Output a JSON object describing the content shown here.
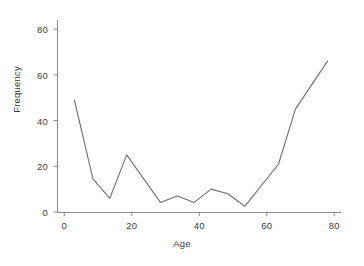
{
  "chart_data": {
    "type": "line",
    "title": "",
    "subtitle": "",
    "xlabel": "Age",
    "ylabel": "Frequency",
    "xlim": [
      -2,
      82
    ],
    "ylim": [
      0,
      84
    ],
    "xticks": [
      0,
      20,
      40,
      60,
      80
    ],
    "xtick_labels": [
      "0",
      "20",
      "40",
      "60",
      "80"
    ],
    "yticks": [
      0,
      20,
      40,
      60,
      80
    ],
    "ytick_labels": [
      "0",
      "20",
      "40",
      "60",
      "80"
    ],
    "grid": false,
    "legend": false,
    "legend_position": "none",
    "line_color": "#6e6e6e",
    "line_width": 1.1,
    "markers": false,
    "x": [
      3,
      8.5,
      13.5,
      18.5,
      28.5,
      33.5,
      38.5,
      43.5,
      48.5,
      53.5,
      63.5,
      68.5,
      78
    ],
    "y": [
      49,
      14.5,
      6,
      25,
      4.2,
      7,
      4.2,
      10,
      8,
      2.5,
      21,
      45,
      66
    ],
    "series": [
      {
        "name": "Frequency",
        "x": [
          3,
          8.5,
          13.5,
          18.5,
          28.5,
          33.5,
          38.5,
          43.5,
          48.5,
          53.5,
          63.5,
          68.5,
          78
        ],
        "values": [
          49,
          14.5,
          6,
          25,
          4.2,
          7,
          4.2,
          10,
          8,
          2.5,
          21,
          45,
          66
        ]
      }
    ]
  },
  "axes": {
    "x_title": "Age",
    "y_title": "Frequency"
  },
  "colors": {
    "line": "#6e6e6e",
    "axis": "#808080",
    "text": "#3c3c3c",
    "background": "#ffffff"
  }
}
